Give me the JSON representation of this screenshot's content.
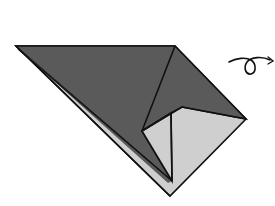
{
  "diagram": {
    "type": "origami-step",
    "colors": {
      "background": "#ffffff",
      "dark_face": "#5a5a5a",
      "light_face": "#cfcfcf",
      "stroke": "#111111"
    },
    "symbols": [
      {
        "name": "turn-over-arrow",
        "meaning": "turn the model over"
      }
    ]
  }
}
